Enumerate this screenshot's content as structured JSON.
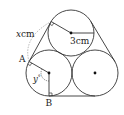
{
  "diagram": {
    "circles": [
      {
        "name": "top",
        "cx": 71,
        "cy": 33,
        "r": 23
      },
      {
        "name": "bottom-left",
        "cx": 49,
        "cy": 73,
        "r": 23
      },
      {
        "name": "bottom-right",
        "cx": 95,
        "cy": 73,
        "r": 23
      }
    ],
    "labels": {
      "radius": "3cm",
      "x_var": "x",
      "x_unit": "cm",
      "point_a": "A",
      "point_b": "B",
      "angle_y": "y"
    },
    "angle_y_suffix": "°",
    "colors": {
      "stroke": "#333333",
      "dashed": "#999999",
      "background": "#ffffff"
    }
  }
}
